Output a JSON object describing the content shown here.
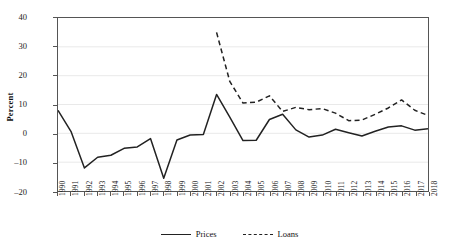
{
  "chart_data": {
    "type": "line",
    "title": "",
    "xlabel": "",
    "ylabel": "Percent",
    "ylim": [
      -20,
      40
    ],
    "yticks": [
      40,
      30,
      20,
      10,
      0,
      -10,
      -20
    ],
    "grid": true,
    "grid_axis": "y",
    "legend_position": "bottom-center",
    "x": [
      1990,
      1991,
      1992,
      1993,
      1994,
      1995,
      1996,
      1997,
      1998,
      1999,
      2000,
      2001,
      2002,
      2003,
      2004,
      2005,
      2006,
      2007,
      2008,
      2009,
      2010,
      2011,
      2012,
      2013,
      2014,
      2015,
      2016,
      2017,
      2018
    ],
    "categories": [
      "1990",
      "1991",
      "1992",
      "1993",
      "1994",
      "1995",
      "1996",
      "1997",
      "1998",
      "1999",
      "2000",
      "2001",
      "2002",
      "2003",
      "2004",
      "2005",
      "2006",
      "2007",
      "2008",
      "2009",
      "2010",
      "2011",
      "2012",
      "2013",
      "2014",
      "2015",
      "2016",
      "2017",
      "2018"
    ],
    "series": [
      {
        "name": "Prices",
        "style": "solid",
        "color": "#222222",
        "x": [
          1990,
          1991,
          1992,
          1993,
          1994,
          1995,
          1996,
          1997,
          1998,
          1999,
          2000,
          2001,
          2002,
          2003,
          2004,
          2005,
          2006,
          2007,
          2008,
          2009,
          2010,
          2011,
          2012,
          2013,
          2014,
          2015,
          2016,
          2017,
          2018
        ],
        "values": [
          8.0,
          0.5,
          -12.0,
          -8.3,
          -7.6,
          -5.2,
          -4.7,
          -1.8,
          -15.6,
          -2.3,
          -0.6,
          -0.4,
          13.5,
          5.6,
          -2.5,
          -2.4,
          4.8,
          6.6,
          1.2,
          -1.3,
          -0.6,
          1.4,
          0.2,
          -0.9,
          0.7,
          2.2,
          2.6,
          1.1,
          1.6
        ]
      },
      {
        "name": "Loans",
        "style": "dashed",
        "color": "#222222",
        "x": [
          2002,
          2003,
          2004,
          2005,
          2006,
          2007,
          2008,
          2009,
          2010,
          2011,
          2012,
          2013,
          2014,
          2015,
          2016,
          2017,
          2018
        ],
        "values": [
          35.0,
          18.0,
          10.5,
          10.8,
          13.0,
          7.6,
          9.0,
          8.2,
          8.6,
          7.0,
          4.4,
          4.6,
          6.6,
          8.8,
          11.6,
          8.0,
          6.2
        ]
      }
    ]
  },
  "legend": {
    "items": [
      {
        "label": "Prices",
        "style": "solid"
      },
      {
        "label": "Loans",
        "style": "dashed"
      }
    ]
  }
}
